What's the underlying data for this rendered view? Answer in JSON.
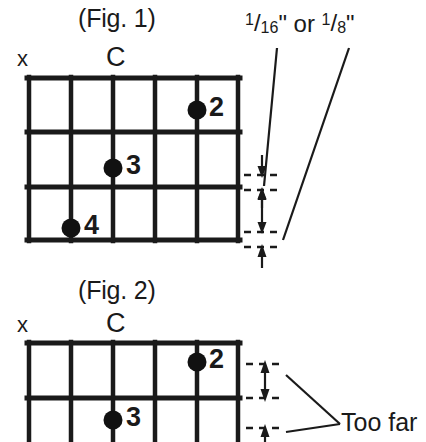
{
  "figure1": {
    "caption": "(Fig. 1)",
    "chord_name": "C",
    "mute_marker": "x",
    "strings": 5,
    "frets": 3,
    "dots": [
      {
        "label": "2",
        "string_index": 4,
        "fret": 1
      },
      {
        "label": "3",
        "string_index": 2,
        "fret": 2
      },
      {
        "label": "4",
        "string_index": 1,
        "fret": 3
      }
    ],
    "dimension_label": {
      "text": "1/16\" or 1/8\"",
      "parts": [
        {
          "numerator": "1",
          "slash": "/",
          "denominator": "16",
          "unit": "\""
        },
        {
          "conjunction": "or"
        },
        {
          "numerator": "1",
          "slash": "/",
          "denominator": "8",
          "unit": "\""
        }
      ]
    }
  },
  "figure2": {
    "caption": "(Fig. 2)",
    "chord_name": "C",
    "mute_marker": "x",
    "strings": 5,
    "frets": 3,
    "dots": [
      {
        "label": "2",
        "string_index": 4,
        "fret": 1
      },
      {
        "label": "3",
        "string_index": 2,
        "fret": 2
      }
    ],
    "annotation": "Too far"
  },
  "colors": {
    "ink": "#1a1a1a",
    "background": "#ffffff",
    "dot_fill": "#111111"
  }
}
